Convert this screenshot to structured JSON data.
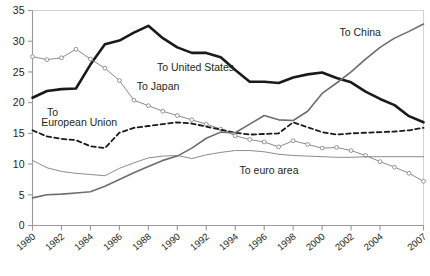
{
  "chart_data": {
    "type": "line",
    "title": "",
    "subtitle": "",
    "xlabel": "",
    "ylabel": "",
    "xlim": [
      1980,
      2007
    ],
    "ylim": [
      0,
      35
    ],
    "grid": false,
    "legend_position": "inline-annotations",
    "y_ticks": [
      0,
      5,
      10,
      15,
      20,
      25,
      30,
      35
    ],
    "x_ticks": [
      1980,
      1982,
      1984,
      1986,
      1988,
      1990,
      1992,
      1994,
      1996,
      1998,
      2000,
      2002,
      2004,
      2007
    ],
    "x_tick_labels": [
      "1980",
      "1982",
      "1984",
      "1986",
      "1988",
      "1990",
      "1992",
      "1994",
      "1996",
      "1998",
      "2000",
      "2002",
      "2004",
      "2007"
    ],
    "x": [
      1980,
      1981,
      1982,
      1983,
      1984,
      1985,
      1986,
      1987,
      1988,
      1989,
      1990,
      1991,
      1992,
      1993,
      1994,
      1995,
      1996,
      1997,
      1998,
      1999,
      2000,
      2001,
      2002,
      2003,
      2004,
      2005,
      2006,
      2007
    ],
    "series": [
      {
        "name": "To United States",
        "label": "To United States",
        "style": "solid",
        "width": 2.6,
        "color": "#1a1a1a",
        "marker": "none",
        "label_x": 1988.6,
        "label_y": 25.2,
        "values": [
          20.8,
          21.9,
          22.2,
          22.3,
          26.2,
          29.5,
          30.1,
          31.4,
          32.5,
          30.5,
          29.0,
          28.1,
          28.1,
          27.4,
          25.3,
          23.4,
          23.4,
          23.2,
          24.1,
          24.6,
          24.9,
          24.0,
          23.3,
          21.8,
          20.6,
          19.6,
          17.8,
          16.8
        ]
      },
      {
        "name": "To Japan",
        "label": "To Japan",
        "style": "solid",
        "width": 1.0,
        "color": "#8a8a8a",
        "marker": "circle",
        "label_x": 1987.2,
        "label_y": 22.0,
        "values": [
          27.5,
          27.0,
          27.3,
          28.7,
          27.1,
          25.6,
          23.6,
          20.4,
          19.5,
          18.6,
          17.9,
          17.2,
          16.5,
          15.7,
          14.6,
          14.0,
          13.6,
          12.8,
          13.8,
          13.2,
          12.6,
          12.7,
          12.2,
          11.4,
          10.4,
          9.5,
          8.5,
          7.2
        ]
      },
      {
        "name": "To European Union",
        "label": "To European Union",
        "style": "dashed",
        "width": 1.8,
        "color": "#1a1a1a",
        "marker": "none",
        "label_x": 1981.0,
        "label_y": 17.3,
        "values": [
          15.5,
          14.5,
          14.1,
          13.9,
          12.9,
          12.6,
          15.1,
          15.9,
          16.2,
          16.5,
          16.8,
          16.6,
          16.1,
          15.6,
          15.1,
          14.8,
          14.9,
          15.0,
          16.8,
          16.0,
          15.2,
          14.8,
          15.0,
          15.1,
          15.2,
          15.3,
          15.5,
          15.9
        ]
      },
      {
        "name": "To euro area",
        "label": "To euro area",
        "style": "solid",
        "width": 0.9,
        "color": "#7f7f7f",
        "marker": "none",
        "label_x": 1994.3,
        "label_y": 8.4,
        "values": [
          10.6,
          9.4,
          8.8,
          8.5,
          8.3,
          8.1,
          9.3,
          10.2,
          11.0,
          11.3,
          11.4,
          10.9,
          11.5,
          11.9,
          12.2,
          12.2,
          12.0,
          11.6,
          11.4,
          11.3,
          11.2,
          11.1,
          11.1,
          11.2,
          11.2,
          11.2,
          11.2,
          11.2
        ]
      },
      {
        "name": "To China",
        "label": "To China",
        "style": "solid",
        "width": 1.6,
        "color": "#6d6d6d",
        "marker": "none",
        "label_x": 2001.4,
        "label_y": 30.9,
        "values": [
          4.5,
          5.0,
          5.1,
          5.3,
          5.5,
          6.4,
          7.5,
          8.6,
          9.6,
          10.6,
          11.3,
          12.6,
          14.2,
          15.2,
          15.1,
          16.5,
          17.9,
          17.2,
          17.1,
          18.6,
          21.5,
          23.2,
          25.0,
          27.1,
          29.0,
          30.5,
          31.6,
          32.8
        ]
      }
    ]
  },
  "axis": {
    "y_labels": [
      "35",
      "30",
      "25",
      "20",
      "15",
      "10",
      "5",
      "0"
    ],
    "x_labels": [
      "1980",
      "1982",
      "1984",
      "1986",
      "1988",
      "1990",
      "1992",
      "1994",
      "1996",
      "1998",
      "2000",
      "2002",
      "2004",
      "2007"
    ]
  },
  "annotations": {
    "to_united_states": "To United States",
    "to_japan": "To Japan",
    "to_eu_line1": "To",
    "to_eu_line2": "European Union",
    "to_euro_area": "To euro area",
    "to_china": "To China"
  },
  "colors": {
    "axis": "#9a9a9a",
    "text": "#231f20",
    "us": "#1a1a1a",
    "japan": "#8a8a8a",
    "eu": "#1a1a1a",
    "euro": "#7f7f7f",
    "china": "#6d6d6d"
  }
}
